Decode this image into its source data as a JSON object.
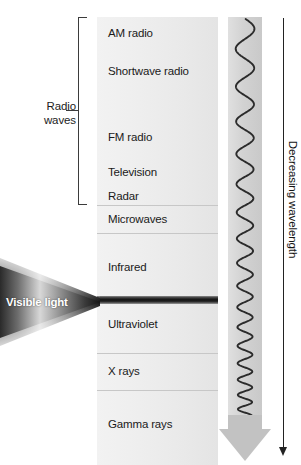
{
  "diagram": {
    "group_bracket": {
      "label_line1": "Radio",
      "label_line2": "waves",
      "covers": [
        "AM radio",
        "Shortwave radio",
        "FM radio",
        "Television",
        "Radar"
      ]
    },
    "bands": [
      {
        "name": "AM radio",
        "top": 0,
        "height": 38,
        "label_y": 10,
        "divider": false
      },
      {
        "name": "Shortwave radio",
        "top": 38,
        "height": 66,
        "label_y": 10,
        "divider": false
      },
      {
        "name": "FM radio",
        "top": 104,
        "height": 38,
        "label_y": 10,
        "divider": false
      },
      {
        "name": "Television",
        "top": 142,
        "height": 28,
        "label_y": 7,
        "divider": false
      },
      {
        "name": "Radar",
        "top": 170,
        "height": 18,
        "label_y": 3,
        "divider": false
      },
      {
        "name": "Microwaves",
        "top": 188,
        "height": 28,
        "label_y": 8,
        "divider": true
      },
      {
        "name": "Infrared",
        "top": 216,
        "height": 63,
        "label_y": 28,
        "divider": true
      },
      {
        "name": "Ultraviolet",
        "top": 287,
        "height": 49,
        "label_y": 14,
        "divider": false
      },
      {
        "name": "X rays",
        "top": 336,
        "height": 37,
        "label_y": 12,
        "divider": true
      },
      {
        "name": "Gamma rays",
        "top": 373,
        "height": 75,
        "label_y": 28,
        "divider": true
      }
    ],
    "visible_light": {
      "label": "Visible light",
      "strip_top": 279,
      "strip_height": 8
    },
    "wavelength_axis": {
      "label": "Decreasing wavelength",
      "direction": "down"
    },
    "colors": {
      "band_fill": "#eeeeee",
      "divider": "#c7c7c7",
      "text": "#1a1a1a",
      "wave_stroke": "#2b2b2b",
      "wave_band": "#d2d2d2",
      "arrow_gray": "#bfbfbf",
      "axis": "#222222",
      "visible_light_text": "#ffffff"
    }
  }
}
